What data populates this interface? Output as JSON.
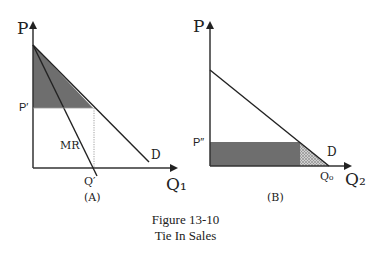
{
  "panel_a": {
    "y_axis_label": "P",
    "x_axis_label": "Q₁",
    "price_label": "P′",
    "quantity_label": "Q′",
    "mr_label": "MR",
    "demand_label": "D",
    "panel_label": "(A)"
  },
  "panel_b": {
    "y_axis_label": "P",
    "x_axis_label": "Q₂",
    "price_label": "P″",
    "quantity_label": "Q₀",
    "demand_label": "D",
    "panel_label": "(B)"
  },
  "caption": {
    "line1": "Figure 13-10",
    "line2": "Tie In Sales"
  },
  "colors": {
    "shade": "#6e6e6e",
    "line": "#222222"
  }
}
